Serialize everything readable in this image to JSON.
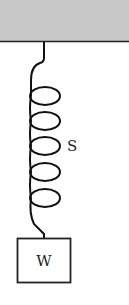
{
  "diagram": {
    "ceiling": {
      "fill": "#c8c8c8",
      "line_color": "#222222"
    },
    "spring": {
      "label": "S",
      "coils": 5,
      "color": "#111111"
    },
    "weight": {
      "label": "W",
      "color": "#222222"
    }
  }
}
